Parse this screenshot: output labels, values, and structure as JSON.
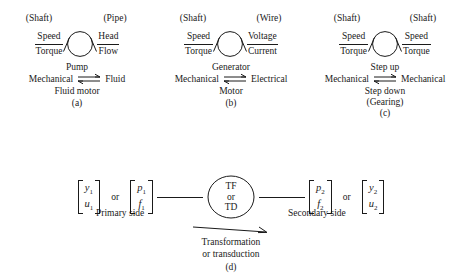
{
  "figure": {
    "caption_d": [
      "Transformation",
      "or transduction"
    ],
    "or_label": "or"
  },
  "panels": [
    {
      "tag": "(a)",
      "port_left": "(Shaft)",
      "port_right": "(Pipe)",
      "left_top": "Speed",
      "left_bottom": "Torque",
      "right_top": "Head",
      "right_bottom": "Flow",
      "forward": "Pump",
      "domain_left": "Mechanical",
      "domain_right": "Fluid",
      "reverse": "Fluid motor",
      "extra": ""
    },
    {
      "tag": "(b)",
      "port_left": "(Shaft)",
      "port_right": "(Wire)",
      "left_top": "Speed",
      "left_bottom": "Torque",
      "right_top": "Voltage",
      "right_bottom": "Current",
      "forward": "Generator",
      "domain_left": "Mechanical",
      "domain_right": "Electrical",
      "reverse": "Motor",
      "extra": ""
    },
    {
      "tag": "(c)",
      "port_left": "(Shaft)",
      "port_right": "(Shaft)",
      "left_top": "Speed",
      "left_bottom": "Torque",
      "right_top": "Speed",
      "right_bottom": "Torque",
      "forward": "Step up",
      "domain_left": "Mechanical",
      "domain_right": "Mechanical",
      "reverse": "Step down",
      "extra": "(Gearing)"
    }
  ],
  "panel_d": {
    "tag": "(d)",
    "element_lines": [
      "TF",
      "or",
      "TD"
    ],
    "primary_label": "Primary side",
    "secondary_label": "Secondary side",
    "primary_matrix_1": {
      "top": "y",
      "top_sub": "1",
      "bottom": "u",
      "bottom_sub": "1"
    },
    "primary_matrix_2": {
      "top": "p",
      "top_sub": "1",
      "bottom": "f",
      "bottom_sub": "1"
    },
    "secondary_matrix_1": {
      "top": "p",
      "top_sub": "2",
      "bottom": "f",
      "bottom_sub": "2"
    },
    "secondary_matrix_2": {
      "top": "y",
      "top_sub": "2",
      "bottom": "u",
      "bottom_sub": "2"
    }
  },
  "colors": {
    "ink": "#1a1a1a",
    "background": "#ffffff"
  }
}
